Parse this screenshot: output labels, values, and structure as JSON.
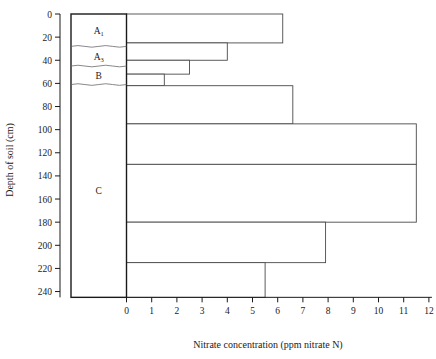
{
  "chart_data": {
    "type": "bar",
    "title": "",
    "orientation": "horizontal",
    "xlabel": "Nitrate concentration (ppm nitrate N)",
    "ylabel": "Depth of soil (cm)",
    "xlim": [
      0,
      12
    ],
    "ylim": [
      0,
      245
    ],
    "y_inverted": true,
    "grid": false,
    "legend": null,
    "xticks": [
      "0",
      "1",
      "2",
      "3",
      "4",
      "5",
      "6",
      "7",
      "8",
      "9",
      "10",
      "11",
      "12"
    ],
    "xtick_values": [
      0,
      1,
      2,
      3,
      4,
      5,
      6,
      7,
      8,
      9,
      10,
      11,
      12
    ],
    "yticks": [
      "0",
      "20",
      "40",
      "60",
      "80",
      "100",
      "120",
      "140",
      "160",
      "180",
      "200",
      "220",
      "240"
    ],
    "ytick_values": [
      0,
      20,
      40,
      60,
      80,
      100,
      120,
      140,
      160,
      180,
      200,
      220,
      240
    ],
    "categories": [
      "0-25",
      "25-40",
      "40-52",
      "52-62",
      "62-95",
      "95-130",
      "130-180",
      "180-215",
      "215-245"
    ],
    "depth_bins": [
      {
        "top": 0,
        "bottom": 25,
        "value": 6.2
      },
      {
        "top": 25,
        "bottom": 40,
        "value": 4.0
      },
      {
        "top": 40,
        "bottom": 52,
        "value": 2.5
      },
      {
        "top": 52,
        "bottom": 62,
        "value": 1.5
      },
      {
        "top": 62,
        "bottom": 95,
        "value": 6.6
      },
      {
        "top": 95,
        "bottom": 130,
        "value": 11.5
      },
      {
        "top": 130,
        "bottom": 180,
        "value": 11.5
      },
      {
        "top": 180,
        "bottom": 215,
        "value": 7.9
      },
      {
        "top": 215,
        "bottom": 245,
        "value": 5.5
      }
    ],
    "values": [
      6.2,
      4.0,
      2.5,
      1.5,
      6.6,
      11.5,
      11.5,
      7.9,
      5.5
    ],
    "soil_profile": {
      "label_name": "soil-profile-column",
      "top": 0,
      "bottom": 245,
      "horizons": [
        {
          "label": "A",
          "subscript": "1",
          "top": 0,
          "bottom": 28,
          "pattern": "diagonal-hatch"
        },
        {
          "label": "A",
          "subscript": "3",
          "top": 28,
          "bottom": 45,
          "pattern": "plain"
        },
        {
          "label": "B",
          "subscript": "",
          "top": 45,
          "bottom": 61,
          "pattern": "plain"
        },
        {
          "label": "C",
          "subscript": "",
          "top": 61,
          "bottom": 245,
          "pattern": "plain"
        }
      ]
    }
  },
  "colors": {
    "axis": "#1a1a1a",
    "bar_stroke": "#4a4a4a",
    "bar_fill": "#ffffff",
    "horizon_stroke": "#6a6a6a",
    "background": "#ffffff"
  }
}
